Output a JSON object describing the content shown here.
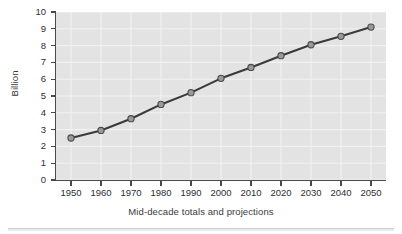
{
  "chart_data": {
    "type": "line",
    "title": "",
    "subtitle": "",
    "xlabel": "Mid-decade totals and projections",
    "ylabel": "Billion",
    "categories": [
      "1950",
      "1960",
      "1970",
      "1980",
      "1990",
      "2000",
      "2010",
      "2020",
      "2030",
      "2040",
      "2050"
    ],
    "x": [
      1950,
      1960,
      1970,
      1980,
      1990,
      2000,
      2010,
      2020,
      2030,
      2040,
      2050
    ],
    "values": [
      2.5,
      2.95,
      3.65,
      4.5,
      5.2,
      6.05,
      6.7,
      7.4,
      8.05,
      8.55,
      9.1
    ],
    "series": [
      {
        "name": "World population",
        "values": [
          2.5,
          2.95,
          3.65,
          4.5,
          5.2,
          6.05,
          6.7,
          7.4,
          8.05,
          8.55,
          9.1
        ]
      }
    ],
    "xlim": [
      1945,
      2055
    ],
    "ylim": [
      0,
      10
    ],
    "ytick_labels": [
      "0",
      "1",
      "2",
      "3",
      "4",
      "5",
      "6",
      "7",
      "8",
      "9",
      "10"
    ],
    "ytick_values": [
      0,
      1,
      2,
      3,
      4,
      5,
      6,
      7,
      8,
      9,
      10
    ],
    "xtick_labels": [
      "1950",
      "1960",
      "1970",
      "1980",
      "1990",
      "2000",
      "2010",
      "2020",
      "2030",
      "2040",
      "2050"
    ],
    "grid": true,
    "grid_color": "#f2f2f2",
    "legend": false,
    "legend_position": "none",
    "plot_background": "#e3e3e3",
    "figure_background": "#ffffff",
    "line_color": "#3a3a3a",
    "marker_fill": "#9a9a9a",
    "marker_edge": "#4a4a4a",
    "marker_shape": "circle",
    "axis_color": "#4a4a4a",
    "annotations": []
  }
}
